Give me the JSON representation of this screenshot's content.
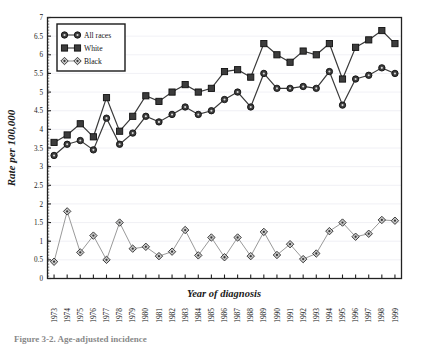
{
  "figure": {
    "caption": "Figure 3-2. Age-adjusted incidence"
  },
  "chart_data": {
    "type": "line",
    "title": "",
    "xlabel": "Year of diagnosis",
    "ylabel": "Rate per 100,000",
    "ylim": [
      0,
      7
    ],
    "ytick_step": 0.5,
    "yticks": [
      "0",
      "0.5",
      "1",
      "1.5",
      "2",
      "2.5",
      "3",
      "3.5",
      "4",
      "4.5",
      "5",
      "5.5",
      "6",
      "6.5",
      "7"
    ],
    "grid": true,
    "grid_axis": "y",
    "legend_position": "top-left",
    "categories": [
      "1973",
      "1974",
      "1975",
      "1976",
      "1977",
      "1978",
      "1979",
      "1980",
      "1981",
      "1982",
      "1983",
      "1984",
      "1985",
      "1986",
      "1987",
      "1988",
      "1989",
      "1990",
      "1991",
      "1992",
      "1993",
      "1994",
      "1995",
      "1996",
      "1997",
      "1998",
      "1999"
    ],
    "series": [
      {
        "name": "All races",
        "marker": "circle",
        "color": "#3a3a3a",
        "values": [
          3.3,
          3.6,
          3.7,
          3.45,
          4.3,
          3.6,
          3.9,
          4.35,
          4.2,
          4.4,
          4.6,
          4.4,
          4.5,
          4.8,
          5.0,
          4.6,
          5.5,
          5.1,
          5.1,
          5.15,
          5.1,
          5.55,
          4.65,
          5.35,
          5.45,
          5.65,
          5.5
        ]
      },
      {
        "name": "White",
        "marker": "square",
        "color": "#2b2b2b",
        "values": [
          3.65,
          3.85,
          4.15,
          3.8,
          4.85,
          3.95,
          4.35,
          4.9,
          4.75,
          5.0,
          5.2,
          5.0,
          5.1,
          5.55,
          5.6,
          5.4,
          6.3,
          6.0,
          5.8,
          6.1,
          6.0,
          6.3,
          5.35,
          6.2,
          6.4,
          6.65,
          6.3
        ]
      },
      {
        "name": "Black",
        "marker": "diamond",
        "color": "#8a8a8a",
        "values": [
          0.45,
          1.8,
          0.7,
          1.15,
          0.5,
          1.5,
          0.8,
          0.85,
          0.6,
          0.72,
          1.3,
          0.62,
          1.1,
          0.57,
          1.1,
          0.6,
          1.25,
          0.63,
          0.92,
          0.52,
          0.67,
          1.27,
          1.5,
          1.12,
          1.2,
          1.57,
          1.55
        ]
      }
    ]
  }
}
